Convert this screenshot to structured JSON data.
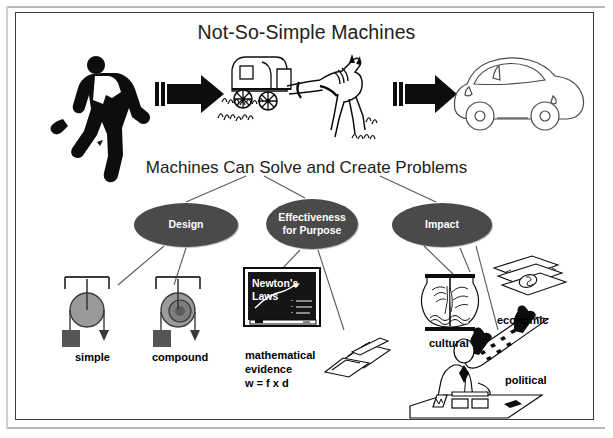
{
  "poster": {
    "title": "Not-So-Simple Machines",
    "subtitle": "Machines Can Solve and Create Problems"
  },
  "progression": {
    "items": [
      {
        "name": "runner",
        "kind": "silhouette"
      },
      {
        "name": "arrow-1",
        "kind": "block-arrow"
      },
      {
        "name": "horse-carriage",
        "kind": "line-art"
      },
      {
        "name": "arrow-2",
        "kind": "block-arrow"
      },
      {
        "name": "automobile",
        "kind": "line-art"
      }
    ]
  },
  "concept_map": {
    "root_label": "Machines Can Solve and Create Problems",
    "nodes": [
      {
        "id": "design",
        "label": "Design"
      },
      {
        "id": "effectiveness",
        "label": "Effectiveness\nfor Purpose"
      },
      {
        "id": "impact",
        "label": "Impact"
      }
    ],
    "node_fill": "#4a4a4a",
    "node_text_color": "#ffffff",
    "leaves": [
      {
        "id": "simple",
        "parent": "design",
        "label": "simple"
      },
      {
        "id": "compound",
        "parent": "design",
        "label": "compound"
      },
      {
        "id": "math",
        "parent": "effectiveness",
        "label": "mathematical\nevidence\nw = f x d"
      },
      {
        "id": "cultural",
        "parent": "impact",
        "label": "cultural"
      },
      {
        "id": "economic",
        "parent": "impact",
        "label": "economic"
      },
      {
        "id": "political",
        "parent": "impact",
        "label": "political"
      }
    ]
  },
  "blackboard": {
    "line1": "Newton's",
    "line2": "Laws"
  },
  "colors": {
    "frame": "#3a3a3a",
    "oval": "#4a4a4a",
    "pulley_wheel": "#9a9a9a",
    "pulley_weight": "#555555",
    "ink": "#000000",
    "page": "#ffffff"
  }
}
